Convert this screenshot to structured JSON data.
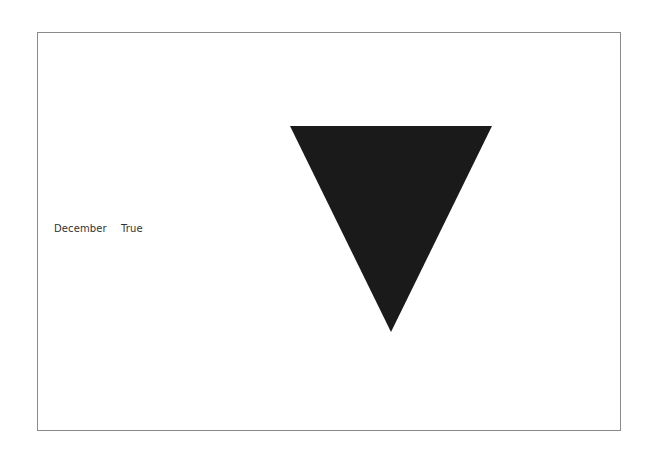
{
  "labels": {
    "month": "December",
    "flag": "True"
  },
  "shape": {
    "type": "triangle-down",
    "color": "#1a1a1a",
    "points": "290,126 492,126 391,332"
  },
  "frame": {
    "border_color": "#8a8a8a"
  }
}
